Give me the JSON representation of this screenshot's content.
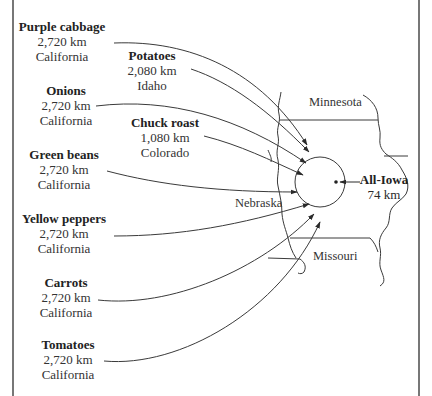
{
  "figure": {
    "top_cut_text": "",
    "destination": {
      "label": "All-Iowa",
      "distance": "74 km"
    },
    "states": {
      "minnesota": "Minnesota",
      "nebraska": "Nebraska",
      "missouri": "Missouri"
    },
    "items": [
      {
        "name": "Purple cabbage",
        "distance": "2,720 km",
        "origin": "California"
      },
      {
        "name": "Potatoes",
        "distance": "2,080 km",
        "origin": "Idaho"
      },
      {
        "name": "Onions",
        "distance": "2,720 km",
        "origin": "California"
      },
      {
        "name": "Chuck roast",
        "distance": "1,080 km",
        "origin": "Colorado"
      },
      {
        "name": "Green beans",
        "distance": "2,720 km",
        "origin": "California"
      },
      {
        "name": "Yellow peppers",
        "distance": "2,720 km",
        "origin": "California"
      },
      {
        "name": "Carrots",
        "distance": "2,720 km",
        "origin": "California"
      },
      {
        "name": "Tomatoes",
        "distance": "2,720 km",
        "origin": "California"
      }
    ],
    "colors": {
      "line": "#3a3a3a",
      "frame": "#555555",
      "text": "#2a2a2a"
    }
  }
}
